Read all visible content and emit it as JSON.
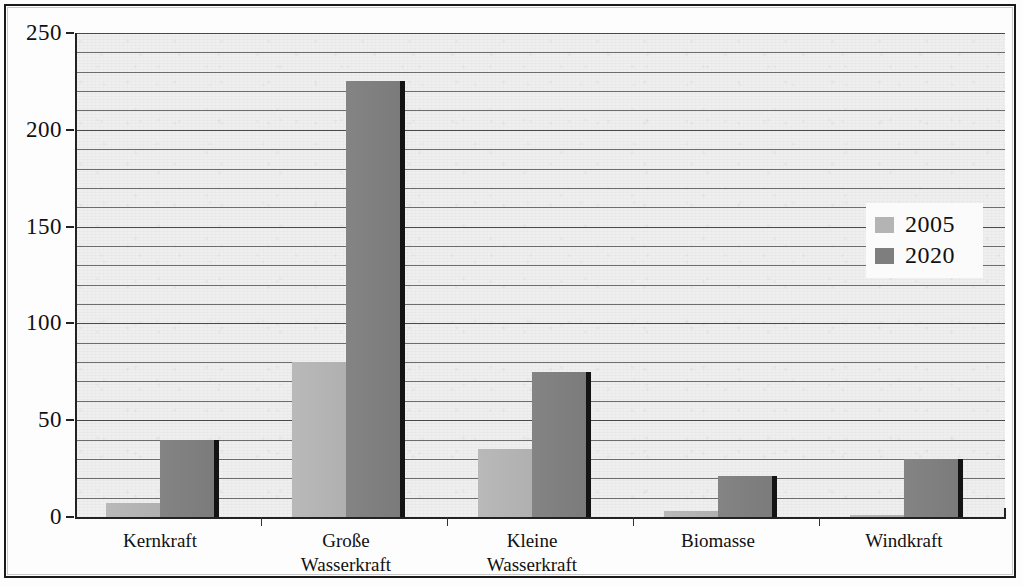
{
  "chart_data": {
    "type": "bar",
    "title": "",
    "subtitle": "",
    "xlabel": "",
    "ylabel": "",
    "ylim": [
      0,
      250
    ],
    "y_ticks": [
      0,
      50,
      100,
      150,
      200,
      250
    ],
    "y_tick_labels": [
      "0",
      "50",
      "100",
      "150",
      "200",
      "250"
    ],
    "minor_gridline_step": 10,
    "grid": true,
    "grid_orientation": "horizontal",
    "legend_position": "right",
    "categories": [
      "Kernkraft",
      "Große\nWasserkraft",
      "Kleine\nWasserkraft",
      "Biomasse",
      "Windkraft"
    ],
    "series": [
      {
        "name": "2005",
        "color": "#b4b4b4",
        "values": [
          7,
          80,
          35,
          3,
          1
        ]
      },
      {
        "name": "2020",
        "color": "#7e7e7e",
        "values": [
          40,
          225,
          75,
          21,
          30
        ]
      }
    ]
  },
  "legend": {
    "entries": [
      {
        "label": "2005",
        "swatch": "s2005"
      },
      {
        "label": "2020",
        "swatch": "s2020"
      }
    ]
  },
  "axes": {
    "y_labels": [
      "250",
      "200",
      "150",
      "100",
      "50",
      "0"
    ]
  }
}
